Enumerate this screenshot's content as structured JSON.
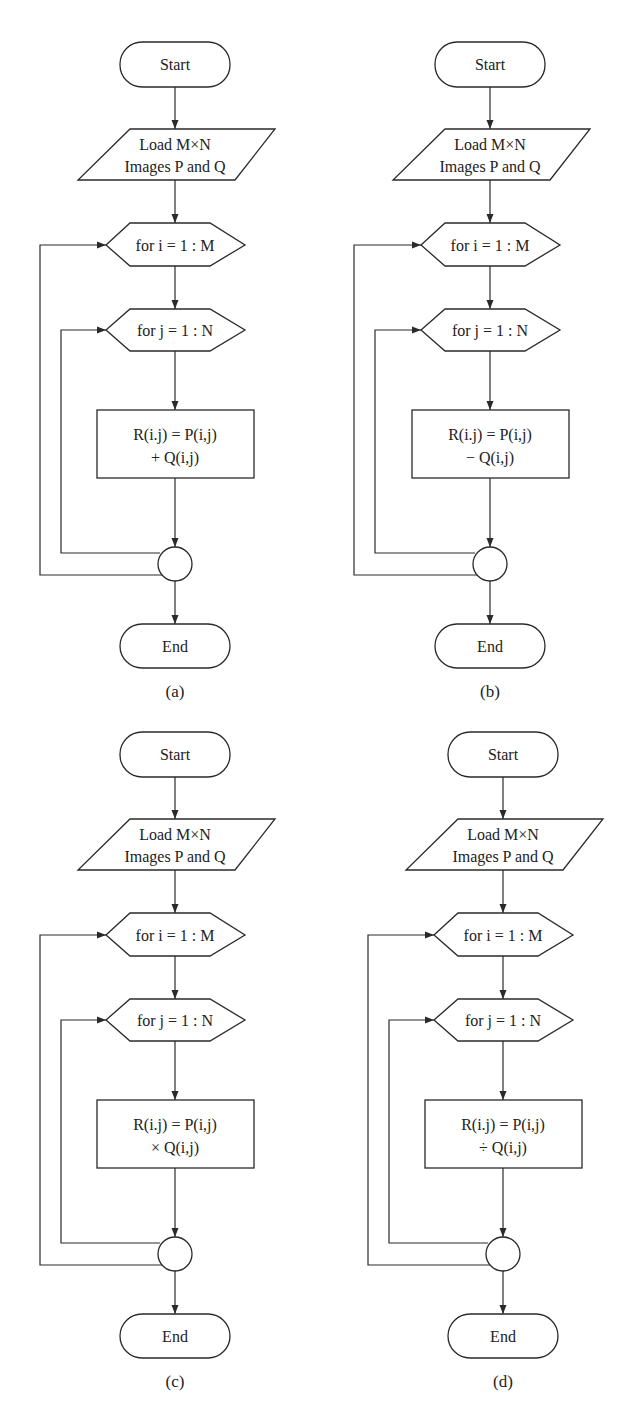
{
  "figure": {
    "panels": [
      {
        "caption": "(a)",
        "start": "Start",
        "load_line1": "Load M×N",
        "load_line2": "Images P and Q",
        "loop_i": "for i = 1 : M",
        "loop_j": "for j = 1 : N",
        "op_line1": "R(i.j) = P(i,j)",
        "op_line2": "+ Q(i,j)",
        "end": "End"
      },
      {
        "caption": "(b)",
        "start": "Start",
        "load_line1": "Load M×N",
        "load_line2": "Images P and Q",
        "loop_i": "for i = 1 : M",
        "loop_j": "for j = 1 : N",
        "op_line1": "R(i.j) = P(i,j)",
        "op_line2": "− Q(i,j)",
        "end": "End"
      },
      {
        "caption": "(c)",
        "start": "Start",
        "load_line1": "Load M×N",
        "load_line2": "Images P and Q",
        "loop_i": "for i = 1 : M",
        "loop_j": "for j = 1 : N",
        "op_line1": "R(i.j) = P(i,j)",
        "op_line2": "× Q(i,j)",
        "end": "End"
      },
      {
        "caption": "(d)",
        "start": "Start",
        "load_line1": "Load M×N",
        "load_line2": "Images P and Q",
        "loop_i": "for i = 1 : M",
        "loop_j": "for j = 1 : N",
        "op_line1": "R(i.j) = P(i,j)",
        "op_line2": "÷ Q(i,j)",
        "end": "End"
      }
    ]
  }
}
